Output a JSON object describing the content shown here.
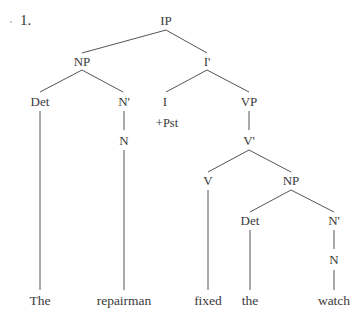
{
  "example_number": "1.",
  "tree": {
    "root": "IP",
    "nodes": {
      "ip": "IP",
      "np_subj": "NP",
      "i_bar": "I'",
      "det_subj": "Det",
      "n_bar_subj": "N'",
      "n_subj": "N",
      "i": "I",
      "i_feature": "+Pst",
      "vp": "VP",
      "v_bar": "V'",
      "v": "V",
      "np_obj": "NP",
      "det_obj": "Det",
      "n_bar_obj": "N'",
      "n_obj": "N"
    },
    "leaves": [
      "The",
      "repairman",
      "fixed",
      "the",
      "watch"
    ]
  }
}
